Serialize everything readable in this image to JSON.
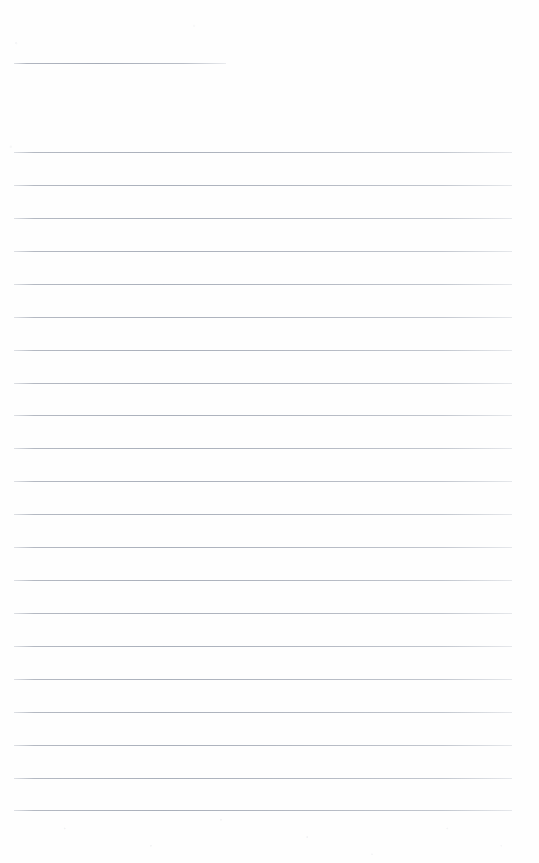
{
  "document": {
    "kind": "ruled-notebook-page",
    "title": "",
    "body_text": "",
    "background_color": "#fefefe",
    "page_width": 539,
    "page_height": 863
  },
  "ruling": {
    "line_color": "#aab0bb",
    "line_thickness_px": 1,
    "left_margin_px": 14,
    "right_edge_px": 512,
    "line_spacing_px": 32.9,
    "full_line_count": 21,
    "header_rule": {
      "name": "header-rule",
      "y": 63,
      "x_start": 14,
      "x_end": 226,
      "width": 212
    },
    "full_lines": [
      {
        "index": 1,
        "y": 152,
        "x_start": 14,
        "x_end": 512
      },
      {
        "index": 2,
        "y": 185,
        "x_start": 14,
        "x_end": 512
      },
      {
        "index": 3,
        "y": 218,
        "x_start": 14,
        "x_end": 512
      },
      {
        "index": 4,
        "y": 251,
        "x_start": 14,
        "x_end": 512
      },
      {
        "index": 5,
        "y": 284,
        "x_start": 14,
        "x_end": 512
      },
      {
        "index": 6,
        "y": 317,
        "x_start": 14,
        "x_end": 512
      },
      {
        "index": 7,
        "y": 350,
        "x_start": 14,
        "x_end": 512
      },
      {
        "index": 8,
        "y": 383,
        "x_start": 14,
        "x_end": 512
      },
      {
        "index": 9,
        "y": 415,
        "x_start": 14,
        "x_end": 512
      },
      {
        "index": 10,
        "y": 448,
        "x_start": 14,
        "x_end": 512
      },
      {
        "index": 11,
        "y": 481,
        "x_start": 14,
        "x_end": 512
      },
      {
        "index": 12,
        "y": 514,
        "x_start": 14,
        "x_end": 512
      },
      {
        "index": 13,
        "y": 547,
        "x_start": 14,
        "x_end": 512
      },
      {
        "index": 14,
        "y": 580,
        "x_start": 14,
        "x_end": 512
      },
      {
        "index": 15,
        "y": 613,
        "x_start": 14,
        "x_end": 512
      },
      {
        "index": 16,
        "y": 646,
        "x_start": 14,
        "x_end": 512
      },
      {
        "index": 17,
        "y": 679,
        "x_start": 14,
        "x_end": 512
      },
      {
        "index": 18,
        "y": 712,
        "x_start": 14,
        "x_end": 512
      },
      {
        "index": 19,
        "y": 745,
        "x_start": 14,
        "x_end": 512
      },
      {
        "index": 20,
        "y": 778,
        "x_start": 14,
        "x_end": 512
      },
      {
        "index": 21,
        "y": 810,
        "x_start": 14,
        "x_end": 512
      }
    ]
  }
}
